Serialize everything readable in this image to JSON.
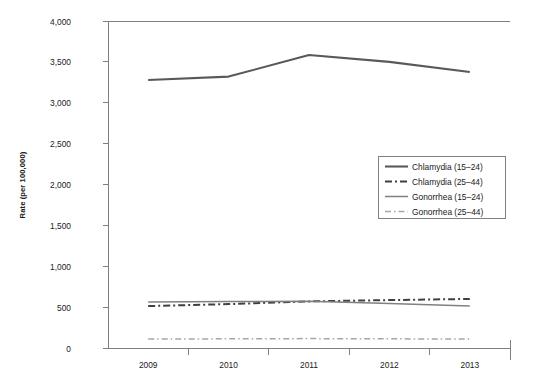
{
  "chart_data": {
    "type": "line",
    "title": "",
    "xlabel": "",
    "ylabel": "Rate (per 100,000)",
    "categories": [
      "2009",
      "2010",
      "2011",
      "2012",
      "2013"
    ],
    "x": [
      2009,
      2010,
      2011,
      2012,
      2013
    ],
    "ylim": [
      0,
      4000
    ],
    "xlim": [
      2009,
      2013
    ],
    "yticks": [
      0,
      500,
      1000,
      1500,
      2000,
      2500,
      3000,
      3500,
      4000
    ],
    "ytick_labels": [
      "0",
      "500",
      "1,000",
      "1,500",
      "2,000",
      "2,500",
      "3,000",
      "3,500",
      "4,000"
    ],
    "grid": false,
    "legend_position": "center-right",
    "series": [
      {
        "name": "Chlamydia (15–24)",
        "values": [
          3278,
          3320,
          3584,
          3500,
          3376
        ],
        "style": "solid",
        "color": "#595959",
        "width": 2.1
      },
      {
        "name": "Chlamydia (25–44)",
        "values": [
          513,
          537,
          570,
          586,
          600
        ],
        "style": "dash-dot",
        "color": "#404040",
        "width": 2.0
      },
      {
        "name": "Gonorrhea (15–24)",
        "values": [
          563,
          568,
          572,
          545,
          514
        ],
        "style": "solid",
        "color": "#808080",
        "width": 1.5
      },
      {
        "name": "Gonorrhea (25–44)",
        "values": [
          110,
          112,
          115,
          112,
          110
        ],
        "style": "dash-dot",
        "color": "#a6a6a6",
        "width": 1.5
      }
    ]
  },
  "legend": {
    "entries": [
      {
        "label": "Chlamydia (15–24)"
      },
      {
        "label": "Chlamydia (25–44)"
      },
      {
        "label": "Gonorrhea (15–24)"
      },
      {
        "label": "Gonorrhea (25–44)"
      }
    ]
  },
  "axes": {
    "y_title": "Rate (per 100,000)",
    "y_labels": [
      "4,000",
      "3,500",
      "3,000",
      "2,500",
      "2,000",
      "1,500",
      "1,000",
      "500",
      "0"
    ],
    "x_labels": [
      "2009",
      "2010",
      "2011",
      "2012",
      "2013"
    ]
  },
  "colors": {
    "axis": "#7f7f7f",
    "text": "#1a1a1a",
    "legend_border": "#808080",
    "background": "#ffffff"
  }
}
